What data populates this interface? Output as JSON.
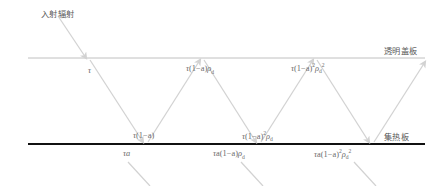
{
  "diagram": {
    "title_visible": false,
    "incident_label": "入射辐射",
    "cover_plate_label": "透明盖板",
    "absorber_plate_label": "集热板",
    "colors": {
      "cover_line": "#b9b9b9",
      "absorber_line": "#111111",
      "ray": "#d2d2d2",
      "text": "#6b6b6b",
      "cjk_text": "#5a5a5a",
      "background": "#ffffff"
    },
    "lines": {
      "cover_plate_y": 58,
      "absorber_plate_y": 144
    },
    "formulas": {
      "top_row": [
        {
          "plain": "τ",
          "tau": "τ",
          "body": "",
          "exp1": "",
          "rho": "",
          "rho_sub": "",
          "rho_exp": ""
        },
        {
          "plain": "τ(1−a)ρd",
          "tau": "τ",
          "body": "(1−a)",
          "exp1": "",
          "rho": "ρ",
          "rho_sub": "d",
          "rho_exp": ""
        },
        {
          "plain": "τ(1−a)²ρd²",
          "tau": "τ",
          "body": "(1−a)",
          "exp1": "2",
          "rho": "ρ",
          "rho_sub": "d",
          "rho_exp": "2"
        }
      ],
      "middle_row": [
        {
          "plain": "τ(1−a)",
          "tau": "τ",
          "body": "(1−a)",
          "exp1": "",
          "rho": "",
          "rho_sub": "",
          "rho_exp": ""
        },
        {
          "plain": "τ(1−a)²ρd",
          "tau": "τ",
          "body": "(1−a)",
          "exp1": "2",
          "rho": "ρ",
          "rho_sub": "d",
          "rho_exp": ""
        }
      ],
      "bottom_row": [
        {
          "plain": "τa",
          "tau": "τ",
          "body": "a",
          "exp1": "",
          "rho": "",
          "rho_sub": "",
          "rho_exp": ""
        },
        {
          "plain": "τa(1−a)ρd",
          "tau": "τ",
          "body": "a(1−a)",
          "exp1": "",
          "rho": "ρ",
          "rho_sub": "d",
          "rho_exp": ""
        },
        {
          "plain": "τa(1−a)²ρd²",
          "tau": "τ",
          "body": "a(1−a)",
          "exp1": "2",
          "rho": "ρ",
          "rho_sub": "d",
          "rho_exp": "2"
        }
      ]
    }
  }
}
